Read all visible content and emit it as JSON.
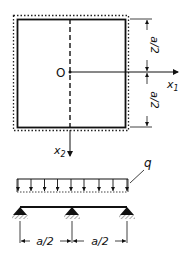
{
  "diagram": {
    "type": "structural plate diagram",
    "plate": {
      "origin_label": "O",
      "axis_x1_label": "x",
      "axis_x1_sub": "1",
      "axis_x2_label": "x",
      "axis_x2_sub": "2",
      "dimension_top": "a/2",
      "dimension_bottom": "a/2"
    },
    "beam": {
      "load_label": "q",
      "load_arrow_count": 9,
      "support_count": 3,
      "span_left": "a/2",
      "span_right": "a/2"
    },
    "colors": {
      "ink": "#111111",
      "background": "#ffffff"
    }
  }
}
